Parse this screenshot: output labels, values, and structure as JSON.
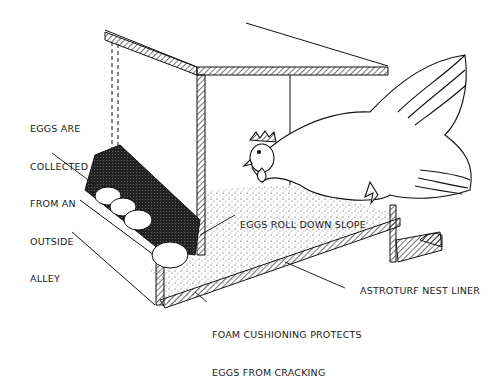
{
  "diagram": {
    "labels": {
      "eggs_collected": [
        "EGGS ARE",
        "COLLECTED",
        "FROM AN",
        "OUTSIDE",
        "ALLEY"
      ],
      "eggs_roll": "EGGS ROLL DOWN SLOPE",
      "astroturf": "ASTROTURF NEST LINER",
      "foam": [
        "FOAM CUSHIONING PROTECTS",
        "EGGS FROM CRACKING"
      ]
    },
    "colors": {
      "line": "#111111",
      "background": "#ffffff"
    }
  }
}
